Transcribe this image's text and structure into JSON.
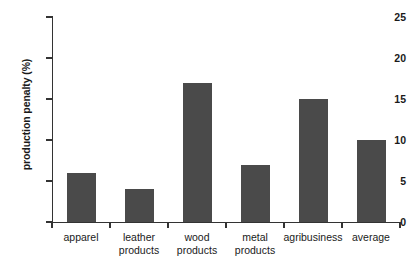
{
  "chart_data": {
    "type": "bar",
    "title": "",
    "subtitle": "",
    "xlabel": "",
    "ylabel": "production penalty (%)",
    "categories": [
      "apparel",
      "leather products",
      "wood products",
      "metal products",
      "agribusiness",
      "average"
    ],
    "category_lines": [
      [
        "apparel"
      ],
      [
        "leather",
        "products"
      ],
      [
        "wood",
        "products"
      ],
      [
        "metal",
        "products"
      ],
      [
        "agribusiness"
      ],
      [
        "average"
      ]
    ],
    "values": [
      6,
      4,
      17,
      7,
      15,
      10
    ],
    "ylim": [
      0,
      25
    ],
    "yticks": [
      0,
      5,
      10,
      15,
      20,
      25
    ],
    "ytick_labels": [
      "0",
      "5",
      "10",
      "15",
      "20",
      "25"
    ],
    "grid": false,
    "legend": null,
    "bar_color": "#4a4a4a",
    "axis_color": "#333333",
    "background_color": "#ffffff"
  }
}
